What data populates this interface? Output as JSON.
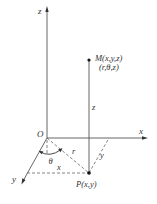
{
  "diagram": {
    "axes": {
      "z_label": "z",
      "x_label": "x",
      "y_label": "y",
      "origin_label": "O"
    },
    "points": {
      "M_label": "M(x,y,z)",
      "M_cyl_label": "(r,θ,z)",
      "P_label": "P(x,y)"
    },
    "segments": {
      "height_label": "z",
      "radius_label": "r",
      "angle_label": "θ",
      "x_proj_label": "x",
      "y_proj_label": "y"
    },
    "colors": {
      "line": "#555555",
      "point": "#111111",
      "background": "#ffffff"
    }
  }
}
